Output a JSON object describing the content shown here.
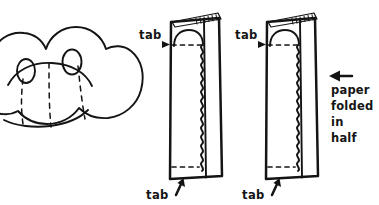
{
  "diagram": {
    "background_color": "#ffffff",
    "ink_color": "#141414",
    "width": 379,
    "height": 205,
    "style": "hand-drawn line art"
  },
  "figures": {
    "blob": {
      "name": "frog-body-blob",
      "description": "rounded cloud-like frog body with two eyes and dashed fold lines",
      "eyes_count": 2,
      "fold_lines_count": 3
    },
    "sheets": [
      {
        "name": "folded-paper-left",
        "fold_note": "paper folded in half",
        "has_wavy_cut": true,
        "has_top_dashed_line": true,
        "has_bottom_dashed_line": true,
        "has_rounded_head_bump": true
      },
      {
        "name": "folded-paper-right",
        "fold_note": "paper folded in half",
        "has_wavy_cut": true,
        "has_top_dashed_line": true,
        "has_bottom_dashed_line": true,
        "has_rounded_head_bump": true
      }
    ]
  },
  "labels": {
    "tab_top_left": "tab",
    "tab_top_right": "tab",
    "tab_bottom_left": "tab",
    "tab_bottom_right": "tab",
    "note_line_1": "paper",
    "note_line_2": "folded",
    "note_line_3": "in",
    "note_line_4": "half"
  }
}
